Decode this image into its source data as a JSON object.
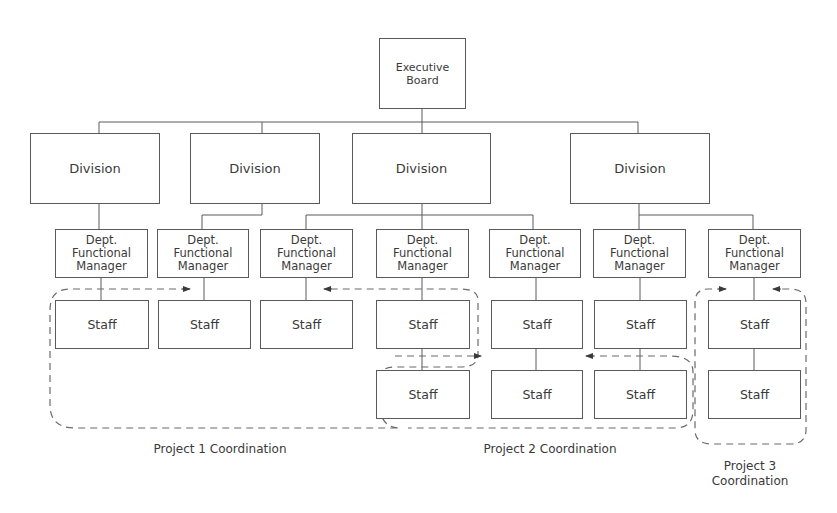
{
  "diagram": {
    "executive": {
      "label": "Executive\nBoard"
    },
    "divisions": [
      {
        "label": "Division"
      },
      {
        "label": "Division"
      },
      {
        "label": "Division"
      },
      {
        "label": "Division"
      }
    ],
    "managers": [
      {
        "label": "Dept.\nFunctional\nManager",
        "division": 1
      },
      {
        "label": "Dept.\nFunctional\nManager",
        "division": 2
      },
      {
        "label": "Dept.\nFunctional\nManager",
        "division": 3
      },
      {
        "label": "Dept.\nFunctional\nManager",
        "division": 3
      },
      {
        "label": "Dept.\nFunctional\nManager",
        "division": 3
      },
      {
        "label": "Dept.\nFunctional\nManager",
        "division": 4
      },
      {
        "label": "Dept.\nFunctional\nManager",
        "division": 4
      }
    ],
    "staff_row1": [
      {
        "label": "Staff"
      },
      {
        "label": "Staff"
      },
      {
        "label": "Staff"
      },
      {
        "label": "Staff"
      },
      {
        "label": "Staff"
      },
      {
        "label": "Staff"
      },
      {
        "label": "Staff"
      }
    ],
    "staff_row2": [
      {
        "label": "Staff",
        "column": 4
      },
      {
        "label": "Staff",
        "column": 5
      },
      {
        "label": "Staff",
        "column": 6
      },
      {
        "label": "Staff",
        "column": 7
      }
    ],
    "projects": [
      {
        "label": "Project 1 Coordination"
      },
      {
        "label": "Project 2 Coordination"
      },
      {
        "label": "Project 3\nCoordination"
      }
    ],
    "colors": {
      "line": "#5a5a5a",
      "dash": "#6a6a6a",
      "text": "#3a3a3a",
      "background": "#ffffff"
    }
  }
}
